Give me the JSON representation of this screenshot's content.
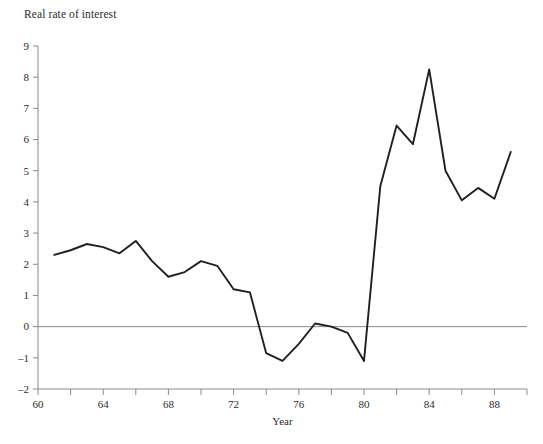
{
  "chart_data": {
    "type": "line",
    "title": "Real rate of interest",
    "xlabel": "Year",
    "ylabel": "",
    "xlim": [
      60,
      90
    ],
    "ylim": [
      -2,
      9
    ],
    "grid": false,
    "legend": null,
    "zero_line": true,
    "x_ticks_major": [
      60,
      64,
      68,
      72,
      76,
      80,
      84,
      88
    ],
    "x_ticks_minor": [
      62,
      66,
      70,
      74,
      78,
      82,
      86,
      90
    ],
    "y_ticks": [
      -2,
      -1,
      0,
      1,
      2,
      3,
      4,
      5,
      6,
      7,
      8,
      9
    ],
    "y_tick_labels": [
      "–2",
      "–1",
      "0",
      "1",
      "2",
      "3",
      "4",
      "5",
      "6",
      "7",
      "8",
      "9"
    ],
    "x_tick_labels": [
      "60",
      "64",
      "68",
      "72",
      "76",
      "80",
      "84",
      "88"
    ],
    "series": [
      {
        "name": "Real rate of interest",
        "color": "#231f20",
        "x": [
          1961,
          1962,
          1963,
          1964,
          1965,
          1966,
          1967,
          1968,
          1969,
          1970,
          1971,
          1972,
          1973,
          1974,
          1975,
          1976,
          1977,
          1978,
          1979,
          1980,
          1981,
          1982,
          1983,
          1984,
          1985,
          1986,
          1987,
          1988,
          1989
        ],
        "values": [
          2.3,
          2.45,
          2.65,
          2.55,
          2.35,
          2.75,
          2.1,
          1.6,
          1.75,
          2.1,
          1.95,
          1.2,
          1.1,
          -0.85,
          -1.1,
          -0.55,
          0.1,
          0.0,
          -0.2,
          -1.1,
          4.5,
          6.45,
          5.85,
          8.25,
          5.0,
          4.05,
          4.45,
          4.1,
          5.6
        ]
      }
    ]
  },
  "axis": {
    "x_name": "Year"
  }
}
